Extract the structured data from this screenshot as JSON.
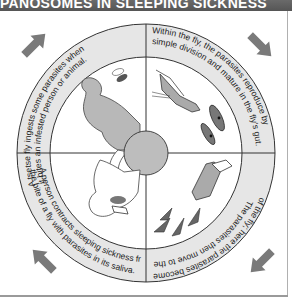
{
  "title": "PANOSOMES IN SLEEPING SICKNESS",
  "colors": {
    "title_bar": "#5e5e5e",
    "ring_fill": "#e6e6e6",
    "arrow": "#7a7a7a",
    "figure_fill": "#b8b8b8",
    "center_circle": "#bdbdbd",
    "outline": "#333333"
  },
  "quadrants": [
    {
      "position": "top-left",
      "line1": "A tsetse fly ingests some parasites when",
      "line2": "it bites an infested person or animal."
    },
    {
      "position": "top-right",
      "line1": "Within the fly, the parasites reproduce by",
      "line2": "simple division and mature in the fly's gut."
    },
    {
      "position": "bottom-right",
      "line1": "The parasites then move to the salivary glands",
      "line2": "of the fly; here the parasites become infective."
    },
    {
      "position": "bottom-left",
      "line1": "A person contracts sleeping sickness from",
      "line2": "the bite of a fly with parasites in its saliva."
    }
  ],
  "arrows": [
    "top-left-arrow",
    "top-right-arrow",
    "bottom-right-arrow",
    "bottom-left-arrow"
  ]
}
